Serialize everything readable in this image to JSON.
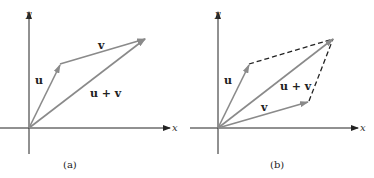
{
  "panels": [
    {
      "id": "a",
      "caption": "(a)",
      "axis_x_label": "x",
      "axis_y_label": "y",
      "vectors": [
        {
          "name": "u",
          "label": "u",
          "style": "solid",
          "color": "#8a8a8a"
        },
        {
          "name": "v",
          "label": "v",
          "style": "solid",
          "color": "#8a8a8a"
        },
        {
          "name": "u+v",
          "label": "u + v",
          "style": "solid",
          "color": "#8a8a8a"
        }
      ]
    },
    {
      "id": "b",
      "caption": "(b)",
      "axis_x_label": "x",
      "axis_y_label": "y",
      "vectors": [
        {
          "name": "u",
          "label": "u",
          "style": "solid",
          "color": "#8a8a8a"
        },
        {
          "name": "v",
          "label": "v",
          "style": "solid",
          "color": "#8a8a8a"
        },
        {
          "name": "u+v",
          "label": "u + v",
          "style": "solid",
          "color": "#8a8a8a"
        }
      ],
      "dashed_edges": [
        "v translated",
        "u translated"
      ]
    }
  ],
  "colors": {
    "axis": "#222222",
    "vector": "#8a8a8a",
    "dashed": "#222222"
  }
}
